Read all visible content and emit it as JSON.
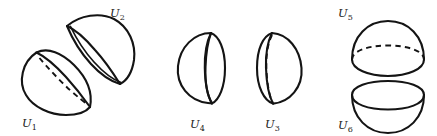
{
  "figure": {
    "background_color": "#ffffff",
    "stroke_color": "#141414",
    "groups": [
      {
        "name": "diagonal-pair",
        "shapes": [
          {
            "id": "U1",
            "label": "U",
            "subscript": "1",
            "orientation": "tilted-lower-left",
            "rim_style": "dashed",
            "label_x": 22,
            "label_y": 127
          },
          {
            "id": "U2",
            "label": "U",
            "subscript": "2",
            "orientation": "tilted-upper-right",
            "rim_style": "solid",
            "label_x": 110,
            "label_y": 17
          }
        ]
      },
      {
        "name": "side-by-side-pair",
        "shapes": [
          {
            "id": "U4",
            "label": "U",
            "subscript": "4",
            "orientation": "left-facing",
            "rim_style": "solid",
            "label_x": 190,
            "label_y": 128
          },
          {
            "id": "U3",
            "label": "U",
            "subscript": "3",
            "orientation": "right-facing",
            "rim_style": "dashed",
            "label_x": 265,
            "label_y": 128
          }
        ]
      },
      {
        "name": "stacked-pair",
        "shapes": [
          {
            "id": "U5",
            "label": "U",
            "subscript": "5",
            "orientation": "dome-up",
            "rim_style": "dashed-back-solid-front",
            "label_x": 338,
            "label_y": 17
          },
          {
            "id": "U6",
            "label": "U",
            "subscript": "6",
            "orientation": "bowl-down",
            "rim_style": "solid-full-ellipse",
            "label_x": 338,
            "label_y": 129
          }
        ]
      }
    ]
  }
}
